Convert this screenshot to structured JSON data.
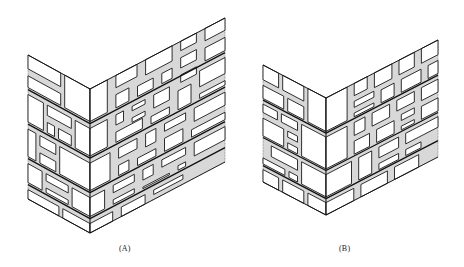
{
  "figure": {
    "type": "isometric wall corner illustrations",
    "panels": [
      {
        "id": "A",
        "label": "(A)",
        "description": "Random rubble / ashlar stone wall corner with large quoin stones and mixed-size stones",
        "apex": [
          90,
          89
        ],
        "height": 144,
        "left_vec": [
          -62,
          -34
        ],
        "right_vec": [
          135,
          -71
        ],
        "courses": [
          0.24,
          0.48,
          0.72,
          0.9
        ],
        "left_stones": [
          [
            0.0,
            0.0,
            0.42,
            0.24
          ],
          [
            0.46,
            0.0,
            1.0,
            0.11
          ],
          [
            0.46,
            0.13,
            1.0,
            0.24
          ],
          [
            0.0,
            0.26,
            0.25,
            0.48
          ],
          [
            0.29,
            0.26,
            0.7,
            0.36
          ],
          [
            0.74,
            0.26,
            1.0,
            0.48
          ],
          [
            0.29,
            0.38,
            0.52,
            0.48
          ],
          [
            0.56,
            0.38,
            0.7,
            0.48
          ],
          [
            0.0,
            0.5,
            0.5,
            0.72
          ],
          [
            0.54,
            0.5,
            0.82,
            0.6
          ],
          [
            0.86,
            0.5,
            1.0,
            0.72
          ],
          [
            0.54,
            0.62,
            0.82,
            0.72
          ],
          [
            0.0,
            0.74,
            0.3,
            0.9
          ],
          [
            0.34,
            0.74,
            0.72,
            0.82
          ],
          [
            0.76,
            0.74,
            1.0,
            0.9
          ],
          [
            0.34,
            0.84,
            0.72,
            0.9
          ],
          [
            0.0,
            0.92,
            0.45,
            1.0
          ],
          [
            0.49,
            0.92,
            1.0,
            1.0
          ]
        ],
        "right_stones": [
          [
            0.0,
            0.0,
            0.14,
            0.24
          ],
          [
            0.18,
            0.0,
            0.36,
            0.1
          ],
          [
            0.4,
            0.0,
            0.62,
            0.12
          ],
          [
            0.66,
            0.0,
            0.8,
            0.08
          ],
          [
            0.84,
            0.0,
            1.0,
            0.1
          ],
          [
            0.18,
            0.12,
            0.3,
            0.24
          ],
          [
            0.34,
            0.14,
            0.48,
            0.24
          ],
          [
            0.52,
            0.14,
            0.62,
            0.24
          ],
          [
            0.66,
            0.1,
            0.8,
            0.2
          ],
          [
            0.84,
            0.12,
            1.0,
            0.24
          ],
          [
            0.66,
            0.22,
            0.8,
            0.3
          ],
          [
            0.0,
            0.26,
            0.14,
            0.48
          ],
          [
            0.18,
            0.26,
            0.26,
            0.36
          ],
          [
            0.3,
            0.26,
            0.42,
            0.32
          ],
          [
            0.46,
            0.26,
            0.6,
            0.38
          ],
          [
            0.64,
            0.32,
            0.76,
            0.48
          ],
          [
            0.8,
            0.26,
            1.0,
            0.4
          ],
          [
            0.18,
            0.38,
            0.4,
            0.48
          ],
          [
            0.3,
            0.34,
            0.42,
            0.4
          ],
          [
            0.44,
            0.4,
            0.6,
            0.48
          ],
          [
            0.8,
            0.42,
            1.0,
            0.48
          ],
          [
            0.0,
            0.5,
            0.16,
            0.72
          ],
          [
            0.2,
            0.5,
            0.36,
            0.6
          ],
          [
            0.4,
            0.5,
            0.5,
            0.62
          ],
          [
            0.54,
            0.5,
            0.72,
            0.58
          ],
          [
            0.76,
            0.5,
            1.0,
            0.62
          ],
          [
            0.2,
            0.62,
            0.3,
            0.72
          ],
          [
            0.34,
            0.64,
            0.5,
            0.72
          ],
          [
            0.54,
            0.6,
            0.7,
            0.72
          ],
          [
            0.74,
            0.64,
            1.0,
            0.72
          ],
          [
            0.0,
            0.74,
            0.12,
            0.9
          ],
          [
            0.16,
            0.74,
            0.34,
            0.82
          ],
          [
            0.38,
            0.74,
            0.48,
            0.84
          ],
          [
            0.52,
            0.74,
            0.72,
            0.82
          ],
          [
            0.76,
            0.74,
            1.0,
            0.86
          ],
          [
            0.16,
            0.84,
            0.34,
            0.9
          ],
          [
            0.38,
            0.86,
            0.6,
            0.9
          ],
          [
            0.64,
            0.84,
            0.72,
            0.9
          ],
          [
            0.0,
            0.92,
            0.18,
            1.0
          ],
          [
            0.22,
            0.92,
            0.42,
            1.0
          ],
          [
            0.46,
            0.92,
            0.7,
            0.98
          ]
        ]
      },
      {
        "id": "B",
        "label": "(B)",
        "description": "Coursed stone wall corner with regular bands and smaller squared stones",
        "apex": [
          326,
          98
        ],
        "height": 117,
        "left_vec": [
          -63,
          -33
        ],
        "right_vec": [
          112,
          -58
        ],
        "courses": [
          0.3,
          0.62,
          0.86
        ],
        "left_stones": [
          [
            0.0,
            0.0,
            0.3,
            0.3
          ],
          [
            0.34,
            0.0,
            0.7,
            0.14
          ],
          [
            0.74,
            0.0,
            1.0,
            0.14
          ],
          [
            0.34,
            0.16,
            0.62,
            0.3
          ],
          [
            0.66,
            0.16,
            1.0,
            0.3
          ],
          [
            0.0,
            0.32,
            0.4,
            0.62
          ],
          [
            0.44,
            0.32,
            0.72,
            0.42
          ],
          [
            0.76,
            0.32,
            1.0,
            0.42
          ],
          [
            0.44,
            0.44,
            0.62,
            0.52
          ],
          [
            0.66,
            0.44,
            1.0,
            0.62
          ],
          [
            0.44,
            0.54,
            0.62,
            0.62
          ],
          [
            0.0,
            0.64,
            0.4,
            0.86
          ],
          [
            0.44,
            0.64,
            0.88,
            0.76
          ],
          [
            0.44,
            0.78,
            0.6,
            0.86
          ],
          [
            0.64,
            0.78,
            1.0,
            0.86
          ],
          [
            0.0,
            0.88,
            0.3,
            1.0
          ],
          [
            0.34,
            0.88,
            0.7,
            1.0
          ],
          [
            0.74,
            0.88,
            1.0,
            1.0
          ]
        ],
        "right_stones": [
          [
            0.0,
            0.0,
            0.2,
            0.3
          ],
          [
            0.24,
            0.0,
            0.38,
            0.12
          ],
          [
            0.42,
            0.0,
            0.6,
            0.14
          ],
          [
            0.64,
            0.0,
            0.8,
            0.14
          ],
          [
            0.84,
            0.0,
            1.0,
            0.14
          ],
          [
            0.24,
            0.14,
            0.44,
            0.22
          ],
          [
            0.48,
            0.16,
            0.62,
            0.3
          ],
          [
            0.66,
            0.16,
            0.86,
            0.3
          ],
          [
            0.24,
            0.24,
            0.44,
            0.3
          ],
          [
            0.9,
            0.16,
            1.0,
            0.3
          ],
          [
            0.0,
            0.32,
            0.2,
            0.62
          ],
          [
            0.24,
            0.32,
            0.36,
            0.46
          ],
          [
            0.4,
            0.32,
            0.58,
            0.46
          ],
          [
            0.62,
            0.32,
            0.8,
            0.44
          ],
          [
            0.84,
            0.32,
            1.0,
            0.46
          ],
          [
            0.24,
            0.48,
            0.4,
            0.62
          ],
          [
            0.44,
            0.48,
            0.62,
            0.62
          ],
          [
            0.66,
            0.46,
            0.8,
            0.54
          ],
          [
            0.84,
            0.48,
            1.0,
            0.62
          ],
          [
            0.66,
            0.56,
            0.8,
            0.62
          ],
          [
            0.0,
            0.64,
            0.24,
            0.86
          ],
          [
            0.28,
            0.64,
            0.42,
            0.86
          ],
          [
            0.46,
            0.64,
            0.66,
            0.76
          ],
          [
            0.7,
            0.64,
            1.0,
            0.76
          ],
          [
            0.46,
            0.78,
            0.66,
            0.86
          ],
          [
            0.7,
            0.78,
            0.86,
            0.86
          ],
          [
            0.0,
            0.88,
            0.26,
            1.0
          ],
          [
            0.3,
            0.88,
            0.56,
            1.0
          ],
          [
            0.6,
            0.88,
            0.84,
            1.0
          ]
        ]
      }
    ]
  },
  "labels": {
    "a": "(A)",
    "b": "(B)"
  },
  "colors": {
    "ink": "#1a1a1a",
    "mortar": "#d8d8d8",
    "paper": "#ffffff"
  }
}
